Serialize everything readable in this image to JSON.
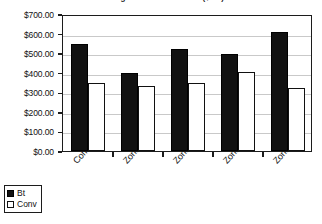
{
  "chart_data": {
    "type": "bar",
    "title": "Average Economic Return ($/ac)",
    "xlabel": "",
    "ylabel": "",
    "categories": [
      "Combined",
      "Zone 1",
      "Zone 2",
      "Zone 4",
      "Zone 5"
    ],
    "series": [
      {
        "name": "Bt",
        "values": [
          548,
          398,
          523,
          498,
          610
        ]
      },
      {
        "name": "Conv",
        "values": [
          348,
          332,
          348,
          406,
          324
        ]
      }
    ],
    "ylim": [
      0,
      700
    ],
    "ytick_values": [
      0,
      100,
      200,
      300,
      400,
      500,
      600,
      700
    ],
    "ytick_labels": [
      "$0.00",
      "$100.00",
      "$200.00",
      "$300.00",
      "$400.00",
      "$500.00",
      "$600.00",
      "$700.00"
    ],
    "grid": true,
    "legend_position": "bottom-left",
    "colors": {
      "series_bt": "#111111",
      "series_conv": "#ffffff",
      "gridline": "#c9c9c9",
      "axis": "#1c1c1c",
      "text": "#111111",
      "background": "#ffffff"
    }
  },
  "legend": {
    "items": [
      {
        "label": "Bt"
      },
      {
        "label": "Conv"
      }
    ]
  }
}
